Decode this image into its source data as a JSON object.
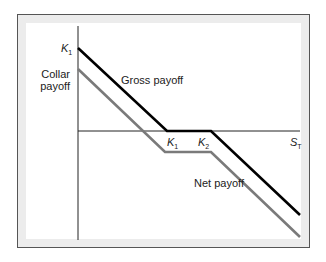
{
  "diagram": {
    "labels": {
      "y_axis_top": "K",
      "y_axis_top_sub": "1",
      "y_axis_label_line1": "Collar",
      "y_axis_label_line2": "payoff",
      "gross_payoff": "Gross payoff",
      "net_payoff": "Net payoff",
      "k1": "K",
      "k1_sub": "1",
      "k2": "K",
      "k2_sub": "2",
      "x_axis": "S",
      "x_axis_sub": "T"
    },
    "series": [
      {
        "name": "Gross payoff",
        "color": "#000000",
        "points": [
          [
            78,
            48
          ],
          [
            167,
            131
          ],
          [
            211,
            131
          ],
          [
            300,
            215
          ]
        ]
      },
      {
        "name": "Net payoff",
        "color": "#7a7a7a",
        "points": [
          [
            78,
            69
          ],
          [
            165,
            152
          ],
          [
            211,
            152
          ],
          [
            300,
            237
          ]
        ]
      }
    ],
    "colors": {
      "frame_border": "#555555",
      "frame_fill": "#ececec",
      "gross": "#000000",
      "net": "#7a7a7a",
      "axis": "#222222"
    }
  }
}
